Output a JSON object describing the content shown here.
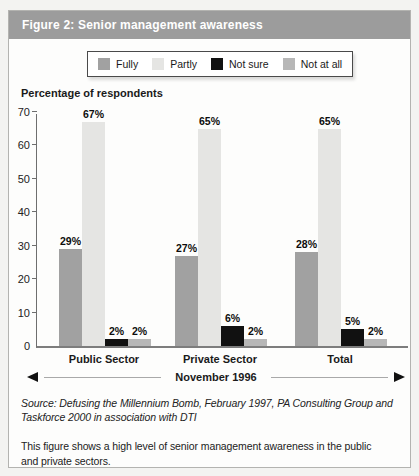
{
  "header": {
    "title": "Figure 2: Senior management awareness"
  },
  "chart_data": {
    "type": "bar",
    "title": "Figure 2: Senior management awareness",
    "ylabel": "Percentage of respondents",
    "xlabel": "",
    "ylim": [
      0,
      70
    ],
    "yticks": [
      0,
      10,
      20,
      30,
      40,
      50,
      60,
      70
    ],
    "grid": false,
    "legend_position": "top",
    "categories": [
      "Public Sector",
      "Private Sector",
      "Total"
    ],
    "series": [
      {
        "name": "Fully",
        "color": "#a1a1a1",
        "values": [
          29,
          67,
          0
        ],
        "values_note": "see corrected values",
        "values_corrected": [
          29,
          27,
          28
        ]
      },
      {
        "name": "Partly",
        "color": "#e5e5e3",
        "values_corrected": [
          67,
          65,
          65
        ]
      },
      {
        "name": "Not sure",
        "color": "#111111",
        "values_corrected": [
          2,
          6,
          5
        ]
      },
      {
        "name": "Not at all",
        "color": "#b7b7b7",
        "values_corrected": [
          2,
          2,
          2
        ]
      }
    ],
    "value_suffix": "%",
    "value_labels": [
      [
        "29%",
        "67%",
        "2%",
        "2%"
      ],
      [
        "27%",
        "65%",
        "6%",
        "2%"
      ],
      [
        "28%",
        "65%",
        "5%",
        "2%"
      ]
    ],
    "x_axis_note": "November 1996"
  },
  "footer": {
    "source_line1": "Source:  Defusing the Millennium Bomb, February 1997, PA Consulting Group and",
    "source_line2": "Taskforce 2000 in association with DTI",
    "caption_line1": "This figure shows a high level of senior management awareness in the public",
    "caption_line2": "and private sectors."
  },
  "colors": {
    "title_bar_bg": "#9c9c9c",
    "title_text": "#ffffff",
    "panel_border": "#b3b3b0",
    "axis": "#6e6e6e",
    "baseline": "#7d7d7d"
  }
}
